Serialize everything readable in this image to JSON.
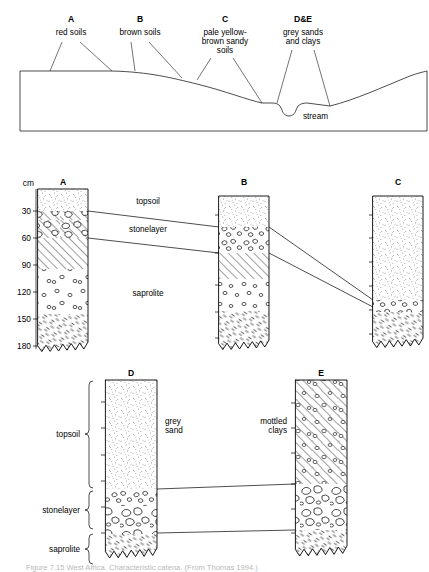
{
  "figure": {
    "caption": "Figure  7.15   West Africa. Characteristic catena. (From Thomas 1994.)"
  },
  "catena": {
    "units": [
      {
        "code": "A",
        "name": "red soils",
        "code_x": 71,
        "code_y": 22,
        "text_x": 71,
        "lines": [
          "red soils"
        ]
      },
      {
        "code": "B",
        "name": "brown soils",
        "code_x": 140,
        "code_y": 22,
        "text_x": 140,
        "lines": [
          "brown soils"
        ]
      },
      {
        "code": "C",
        "name": "pale yellow-brown sandy soils",
        "code_x": 225,
        "code_y": 22,
        "text_x": 225,
        "lines": [
          "pale yellow-",
          "brown sandy",
          "soils"
        ]
      },
      {
        "code": "D&E",
        "name": "grey sands and clays",
        "code_x": 303,
        "code_y": 22,
        "text_x": 303,
        "lines": [
          "grey sands",
          "and clays"
        ]
      }
    ],
    "stream_label": "stream"
  },
  "middle_section": {
    "axis_unit_label": "cm",
    "depth_ticks": [
      "30",
      "60",
      "90",
      "120",
      "150",
      "180"
    ],
    "horizon_labels": [
      "topsoil",
      "stonelayer",
      "saprolite"
    ],
    "profiles": [
      {
        "code": "A",
        "x": 38,
        "width": 50
      },
      {
        "code": "B",
        "x": 219,
        "width": 50
      },
      {
        "code": "C",
        "x": 373,
        "width": 50
      }
    ]
  },
  "bottom_section": {
    "horizon_labels": [
      "topsoil",
      "stonelayer",
      "saprolite"
    ],
    "profiles": [
      {
        "code": "D",
        "x": 105,
        "width": 52,
        "material_lines": [
          "grey",
          "sand"
        ]
      },
      {
        "code": "E",
        "x": 295,
        "width": 52,
        "material_lines": [
          "mottled",
          "clays"
        ]
      }
    ]
  }
}
